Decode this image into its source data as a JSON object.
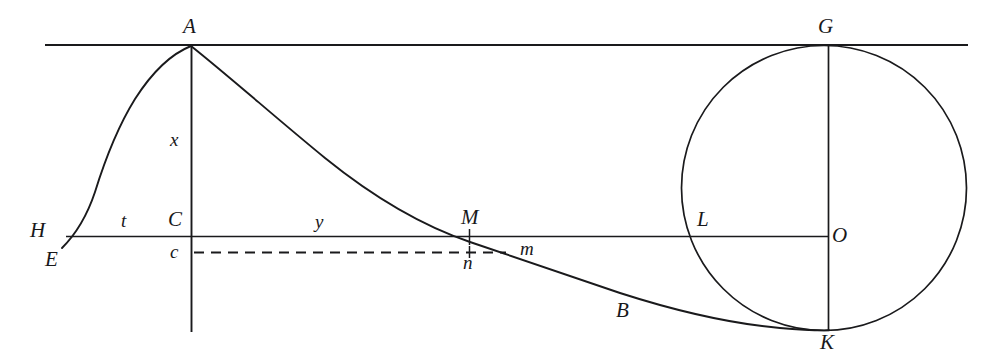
{
  "figure": {
    "kind": "geometric-diagram",
    "width": 1003,
    "height": 364,
    "background_color": "#ffffff",
    "stroke_color": "#1a1a1c"
  },
  "labels": {
    "A": "A",
    "B": "B",
    "C": "C",
    "E": "E",
    "G": "G",
    "H": "H",
    "K": "K",
    "L": "L",
    "M": "M",
    "O": "O",
    "c": "c",
    "m": "m",
    "n": "n",
    "t": "t",
    "x": "x",
    "y": "y"
  },
  "label_positions": {
    "A": {
      "x": 183,
      "y": 22
    },
    "B": {
      "x": 618,
      "y": 302
    },
    "C": {
      "x": 169,
      "y": 212
    },
    "E": {
      "x": 47,
      "y": 252
    },
    "G": {
      "x": 820,
      "y": 22
    },
    "H": {
      "x": 32,
      "y": 223
    },
    "K": {
      "x": 821,
      "y": 334
    },
    "L": {
      "x": 698,
      "y": 212
    },
    "M": {
      "x": 462,
      "y": 210
    },
    "O": {
      "x": 833,
      "y": 228
    },
    "c": {
      "x": 170,
      "y": 243
    },
    "m": {
      "x": 521,
      "y": 240
    },
    "n": {
      "x": 464,
      "y": 254
    },
    "t": {
      "x": 122,
      "y": 212
    },
    "x": {
      "x": 171,
      "y": 130
    },
    "y": {
      "x": 316,
      "y": 213
    }
  },
  "geometry": {
    "top_line": {
      "x1": 45,
      "y1": 45,
      "x2": 968,
      "y2": 45
    },
    "base_line": {
      "x1": 66,
      "y1": 236,
      "x2": 828,
      "y2": 236
    },
    "vertical_line_AC": {
      "x": 191,
      "y1": 45,
      "y2": 332
    },
    "vertical_line_GK": {
      "x": 828,
      "y1": 45,
      "y2": 330
    },
    "dashed_line_cn": {
      "x1": 194,
      "y": 252,
      "x2": 506
    },
    "circle": {
      "cx": 824,
      "cy": 188,
      "r": 142
    },
    "point_A": {
      "x": 191,
      "y": 45
    },
    "point_C": {
      "x": 191,
      "y": 236
    },
    "point_M": {
      "x": 469,
      "y": 236
    },
    "point_G": {
      "x": 828,
      "y": 45
    },
    "point_K": {
      "x": 828,
      "y": 330
    },
    "point_L": {
      "x": 692,
      "y": 236
    },
    "point_O": {
      "x": 828,
      "y": 236
    },
    "point_E": {
      "x": 62,
      "y": 247
    },
    "tick_at_M": {
      "x": 469,
      "y1": 229,
      "y2": 244
    },
    "tick_at_n": {
      "x": 469,
      "y1": 246,
      "y2": 258
    }
  },
  "curves": {
    "left_branch_AE": "M 191 45 C 160 60 126 112 104 170 C 94 198 80 226 62 247",
    "right_branch_AK": "M 191 45 C 250 90 320 150 392 198 C 470 250 600 300 700 320 C 760 331 800 333 828 330",
    "circle_path_note": "full circle tangent to top line at G and to the curve near K"
  }
}
